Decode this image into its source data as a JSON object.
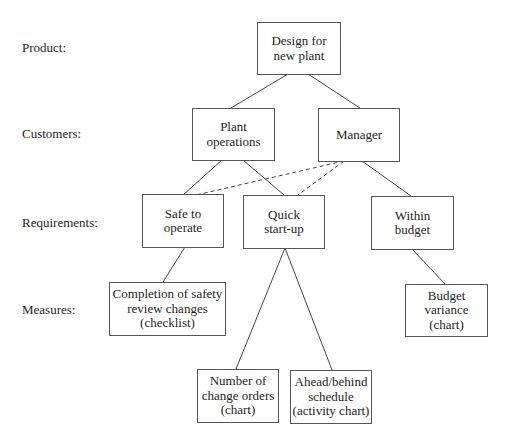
{
  "diagram": {
    "row_labels": {
      "product": "Product:",
      "customers": "Customers:",
      "requirements": "Requirements:",
      "measures": "Measures:"
    },
    "nodes": {
      "design": "Design for\nnew plant",
      "plant_operations": "Plant\noperations",
      "manager": "Manager",
      "safe_to_operate": "Safe to\noperate",
      "quick_startup": "Quick\nstart-up",
      "within_budget": "Within\nbudget",
      "completion_safety": "Completion of safety\nreview changes\n(checklist)",
      "budget_variance": "Budget\nvariance\n(chart)",
      "change_orders": "Number of\nchange orders\n(chart)",
      "ahead_behind": "Ahead/behind\nschedule\n(activity chart)"
    },
    "edges": [
      {
        "from": "design",
        "to": "plant_operations",
        "style": "solid"
      },
      {
        "from": "design",
        "to": "manager",
        "style": "solid"
      },
      {
        "from": "plant_operations",
        "to": "safe_to_operate",
        "style": "solid"
      },
      {
        "from": "plant_operations",
        "to": "quick_startup",
        "style": "solid"
      },
      {
        "from": "manager",
        "to": "safe_to_operate",
        "style": "dashed"
      },
      {
        "from": "manager",
        "to": "quick_startup",
        "style": "dashed"
      },
      {
        "from": "manager",
        "to": "within_budget",
        "style": "solid"
      },
      {
        "from": "safe_to_operate",
        "to": "completion_safety",
        "style": "solid"
      },
      {
        "from": "quick_startup",
        "to": "change_orders",
        "style": "solid"
      },
      {
        "from": "quick_startup",
        "to": "ahead_behind",
        "style": "solid"
      },
      {
        "from": "within_budget",
        "to": "budget_variance",
        "style": "solid"
      }
    ],
    "colors": {
      "line": "#444444",
      "border": "#555555",
      "text": "#1e1e1e",
      "background": "#ffffff"
    }
  }
}
